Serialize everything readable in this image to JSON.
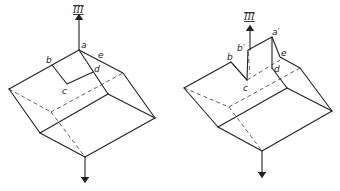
{
  "figures": [
    {
      "id": "left",
      "axis_label": "III",
      "labels": {
        "a": "a",
        "b": "b",
        "c": "c",
        "d": "d",
        "e": "e"
      }
    },
    {
      "id": "right",
      "axis_label": "III",
      "labels": {
        "a_prime": "a′",
        "b_prime": "b′",
        "b": "b",
        "c": "c",
        "d": "d",
        "e": "e"
      }
    }
  ],
  "colors": {
    "line": "#222222",
    "background": "#ffffff"
  }
}
